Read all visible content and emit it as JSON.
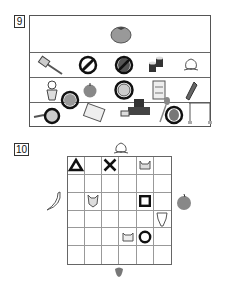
{
  "question9": {
    "number": "9",
    "rows": [
      {
        "items": [
          {
            "icon": "tomato-icon",
            "crossed": false
          }
        ]
      },
      {
        "items": [
          {
            "icon": "hatchet-icon",
            "crossed": false
          },
          {
            "icon": "banana-icon",
            "crossed": true
          },
          {
            "icon": "eggplant-icon",
            "crossed": true
          },
          {
            "icon": "sushi-rolls-icon",
            "crossed": false
          },
          {
            "icon": "peach-icon",
            "crossed": false
          }
        ]
      },
      {
        "items": [
          {
            "icon": "girl-icon",
            "crossed": false
          },
          {
            "icon": "apple-icon",
            "crossed": false
          },
          {
            "icon": "lion-icon",
            "crossed": true
          },
          {
            "icon": "notebook-icon",
            "crossed": false
          },
          {
            "icon": "corn-icon",
            "crossed": false
          }
        ]
      },
      {
        "items": [
          {
            "icon": "frying-pan-icon",
            "crossed": true
          },
          {
            "icon": "watermelon-icon",
            "crossed": true
          },
          {
            "icon": "waffle-icon",
            "crossed": false
          },
          {
            "icon": "bulldozer-icon",
            "crossed": false
          },
          {
            "icon": "spoon-icon",
            "crossed": false
          },
          {
            "icon": "pepper-icon",
            "crossed": true
          },
          {
            "icon": "high-bar-icon",
            "crossed": false
          }
        ]
      }
    ]
  },
  "question10": {
    "number": "10",
    "grid": {
      "rows": 6,
      "cols": 6
    },
    "cells": [
      {
        "row": 0,
        "col": 0,
        "symbol": "triangle"
      },
      {
        "row": 0,
        "col": 2,
        "symbol": "cross"
      },
      {
        "row": 0,
        "col": 4,
        "symbol": "cat-face"
      },
      {
        "row": 2,
        "col": 1,
        "symbol": "fox-face"
      },
      {
        "row": 2,
        "col": 4,
        "symbol": "square"
      },
      {
        "row": 3,
        "col": 5,
        "symbol": "giraffe-face"
      },
      {
        "row": 4,
        "col": 3,
        "symbol": "raccoon-face"
      },
      {
        "row": 4,
        "col": 4,
        "symbol": "circle"
      }
    ],
    "outside": {
      "top": "peach-icon",
      "left": "banana-icon",
      "right": "apple-icon",
      "bottom": "strawberry-icon"
    }
  },
  "colors": {
    "ink": "#222222",
    "line": "#666666",
    "fruit_red": "#8a8a8a"
  }
}
